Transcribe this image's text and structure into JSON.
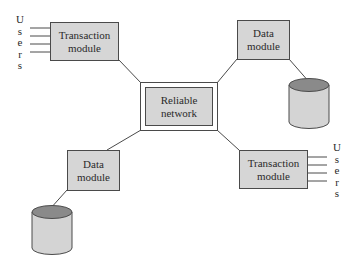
{
  "diagram": {
    "title": "",
    "nodes": {
      "network": {
        "line1": "Reliable",
        "line2": "network"
      },
      "tm_top_left": {
        "line1": "Transaction",
        "line2": "module"
      },
      "dm_top_right": {
        "line1": "Data",
        "line2": "module"
      },
      "dm_bottom_left": {
        "line1": "Data",
        "line2": "module"
      },
      "tm_bottom_right": {
        "line1": "Transaction",
        "line2": "module"
      }
    },
    "users_left": {
      "letters": [
        "U",
        "s",
        "e",
        "r",
        "s"
      ]
    },
    "users_right": {
      "letters": [
        "U",
        "s",
        "e",
        "r",
        "s"
      ]
    },
    "edges": [
      [
        "tm_top_left",
        "network"
      ],
      [
        "dm_top_right",
        "network"
      ],
      [
        "dm_bottom_left",
        "network"
      ],
      [
        "tm_bottom_right",
        "network"
      ],
      [
        "dm_top_right",
        "database_top_right"
      ],
      [
        "dm_bottom_left",
        "database_bottom_left"
      ]
    ],
    "colors": {
      "box_fill": "#d6d6d6",
      "stroke": "#4a4a4a",
      "cylinder_top": "#8a8a8a",
      "cylinder_body": "#d4d4d4"
    }
  }
}
